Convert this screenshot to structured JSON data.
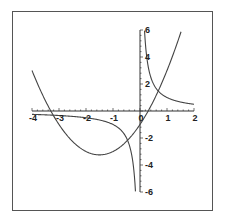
{
  "chart_data": {
    "type": "line",
    "title": "",
    "xlabel": "",
    "ylabel": "",
    "xlim": [
      -4,
      2
    ],
    "ylim": [
      -6,
      6
    ],
    "grid": false,
    "legend": null,
    "axes_style": "crossing at origin",
    "x_ticks": [
      "-4",
      "-3",
      "-2",
      "-1",
      "0",
      "1",
      "2"
    ],
    "y_ticks": [
      "-6",
      "-4",
      "-2",
      "2",
      "4",
      "6"
    ],
    "series": [
      {
        "name": "y = x^2 + 3x - 1",
        "x": [
          -4,
          -3.5,
          -3,
          -2.5,
          -2,
          -1.5,
          -1,
          -0.5,
          0,
          0.5,
          1,
          1.5
        ],
        "values": [
          3,
          0.75,
          -1,
          -2.25,
          -3,
          -3.25,
          -3,
          -2.25,
          -1,
          0.75,
          3,
          5.75
        ]
      },
      {
        "name": "y = 1/x (left branch)",
        "x": [
          -4,
          -3,
          -2,
          -1,
          -0.5,
          -0.3,
          -0.2,
          -0.17
        ],
        "values": [
          -0.25,
          -0.33,
          -0.5,
          -1,
          -2,
          -3.33,
          -5,
          -5.9
        ]
      },
      {
        "name": "y = 1/x (right branch)",
        "x": [
          0.17,
          0.2,
          0.3,
          0.5,
          1,
          1.5,
          2
        ],
        "values": [
          5.9,
          5,
          3.33,
          2,
          1,
          0.67,
          0.5
        ]
      }
    ]
  },
  "colors": {
    "curve": "#444444",
    "axis": "#333333",
    "frame": "#555555"
  }
}
